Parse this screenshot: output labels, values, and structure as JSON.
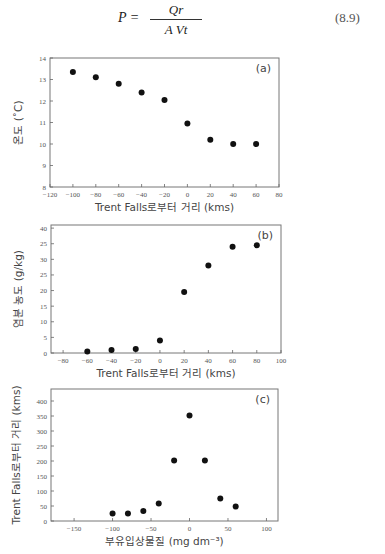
{
  "equation": {
    "lhs": "P =",
    "numerator": "Qr",
    "denominator": "A Vt",
    "number": "(8.9)"
  },
  "chart_data": [
    {
      "type": "scatter",
      "panel_label": "(a)",
      "xlabel": "Trent Falls로부터 거리 (kms)",
      "ylabel": "온도 (˚C)",
      "xlim": [
        -120,
        80
      ],
      "ylim": [
        8,
        14
      ],
      "xticks": [
        -120,
        -100,
        -80,
        -60,
        -40,
        -20,
        0,
        20,
        40,
        60,
        80
      ],
      "xtick_labels": [
        "−120",
        "−100",
        "−80",
        "−60",
        "−40",
        "−20",
        "0",
        "20",
        "40",
        "60",
        "80"
      ],
      "yticks": [
        8,
        9,
        10,
        11,
        12,
        13,
        14
      ],
      "ytick_labels": [
        "8",
        "9",
        "10",
        "11",
        "12",
        "13",
        "14"
      ],
      "x": [
        -100,
        -80,
        -60,
        -40,
        -20,
        0,
        20,
        40,
        60
      ],
      "y": [
        13.35,
        13.1,
        12.8,
        12.4,
        12.05,
        10.95,
        10.2,
        10.0,
        10.0
      ],
      "grid": false
    },
    {
      "type": "scatter",
      "panel_label": "(b)",
      "xlabel": "Trent Falls로부터 거리 (kms)",
      "ylabel": "염분 농도 (g/kg)",
      "xlim": [
        -90,
        100
      ],
      "ylim": [
        0,
        41
      ],
      "xticks": [
        -80,
        -60,
        -40,
        -20,
        0,
        20,
        40,
        60,
        80,
        100
      ],
      "xtick_labels": [
        "−80",
        "−60",
        "−40",
        "−20",
        "0",
        "20",
        "40",
        "60",
        "80",
        "100"
      ],
      "yticks": [
        0,
        5,
        10,
        15,
        20,
        25,
        30,
        35,
        40
      ],
      "ytick_labels": [
        "0",
        "5",
        "10",
        "15",
        "20",
        "25",
        "30",
        "25",
        "40"
      ],
      "x": [
        -60,
        -40,
        -20,
        0,
        20,
        40,
        60,
        80
      ],
      "y": [
        0.5,
        1.0,
        1.3,
        4.0,
        19.5,
        28.0,
        34.0,
        34.5
      ],
      "grid": false
    },
    {
      "type": "scatter",
      "panel_label": "(c)",
      "xlabel": "부유입상물질 (mg dm⁻³)",
      "ylabel": "Trent Falls로부터 거리 (kms)",
      "xlim": [
        -180,
        115
      ],
      "ylim": [
        0,
        440
      ],
      "xticks": [
        -150,
        -100,
        -50,
        0,
        50,
        100
      ],
      "xtick_labels": [
        "−150",
        "−100",
        "−50",
        "0",
        "50",
        "100"
      ],
      "yticks": [
        0,
        50,
        100,
        150,
        200,
        250,
        300,
        350,
        400
      ],
      "ytick_labels": [
        "0",
        "50",
        "100",
        "150",
        "200",
        "250",
        "300",
        "350",
        "400"
      ],
      "x": [
        -100,
        -80,
        -60,
        -40,
        -20,
        0,
        20,
        40,
        60
      ],
      "y": [
        25,
        25,
        33,
        58,
        202,
        352,
        202,
        75,
        48
      ],
      "grid": false
    }
  ],
  "layout": {
    "panels": [
      {
        "top": 58,
        "left": 50,
        "right": 279,
        "bottom": 187
      },
      {
        "top": 225,
        "left": 51,
        "right": 281,
        "bottom": 353
      },
      {
        "top": 389,
        "left": 51,
        "right": 278,
        "bottom": 521
      }
    ]
  }
}
